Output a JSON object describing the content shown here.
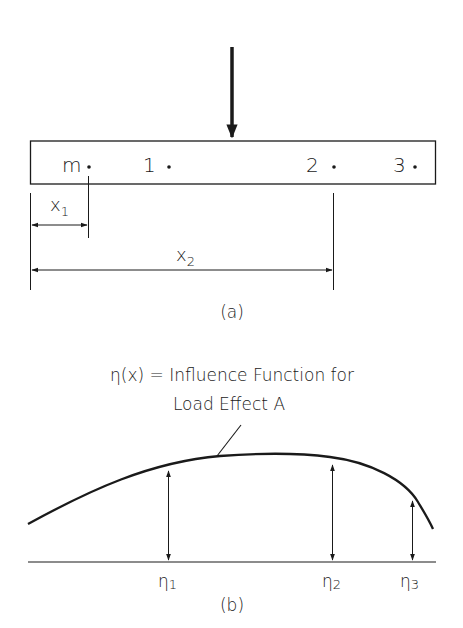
{
  "part_a": {
    "caption": "(a)",
    "beam_points": [
      {
        "label": "m"
      },
      {
        "label": "1"
      },
      {
        "label": "2"
      },
      {
        "label": "3"
      }
    ],
    "dimensions": [
      {
        "label": "x",
        "subscript": "1"
      },
      {
        "label": "x",
        "subscript": "2"
      }
    ]
  },
  "part_b": {
    "caption": "(b)",
    "title_line1": "η(x) = Influence Function for",
    "title_line2": "Load Effect A",
    "ordinates": [
      {
        "label": "η",
        "subscript": "1"
      },
      {
        "label": "η",
        "subscript": "2"
      },
      {
        "label": "η",
        "subscript": "3"
      }
    ]
  },
  "colors": {
    "ink": "#1a1a1a",
    "background": "#ffffff"
  }
}
